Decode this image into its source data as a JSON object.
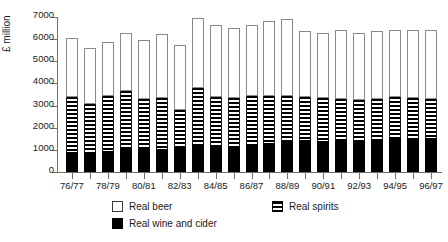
{
  "chart_data": {
    "type": "bar",
    "stacked": true,
    "title": "",
    "xlabel": "",
    "ylabel": "£ million",
    "ylim": [
      0,
      7000
    ],
    "ytick_values": [
      0,
      1000,
      2000,
      3000,
      4000,
      5000,
      6000,
      7000
    ],
    "ytick_labels": [
      "0",
      "1000",
      "2000",
      "3000",
      "4000",
      "5000",
      "6000",
      "7000"
    ],
    "grid": false,
    "legend_position": "below-plot",
    "categories": [
      "76/77",
      "77/78",
      "78/79",
      "79/80",
      "80/81",
      "81/82",
      "82/83",
      "83/84",
      "84/85",
      "85/86",
      "86/87",
      "87/88",
      "88/89",
      "89/90",
      "90/91",
      "91/92",
      "92/93",
      "93/94",
      "94/95",
      "95/96",
      "96/97"
    ],
    "xtick_labels_shown": [
      "76/77",
      "78/79",
      "80/81",
      "82/83",
      "84/85",
      "86/87",
      "88/89",
      "90/91",
      "92/93",
      "94/95",
      "96/97"
    ],
    "series": [
      {
        "name": "Real wine and cider",
        "style": "solid-black",
        "color": "#000000",
        "values": [
          900,
          900,
          950,
          1050,
          1050,
          1050,
          1100,
          1250,
          1200,
          1150,
          1200,
          1300,
          1400,
          1450,
          1400,
          1400,
          1450,
          1500,
          1600,
          1550,
          1550
        ]
      },
      {
        "name": "Real spirits",
        "style": "horizontal-stripes",
        "color": "#000000",
        "values": [
          2500,
          2150,
          2500,
          2600,
          2250,
          2300,
          1700,
          2550,
          2200,
          2200,
          2250,
          2150,
          2050,
          1950,
          1950,
          1900,
          1800,
          1800,
          1800,
          1800,
          1750
        ]
      },
      {
        "name": "Real beer",
        "style": "white-outline",
        "color": "#ffffff",
        "values": [
          2650,
          2550,
          2400,
          2650,
          2650,
          2900,
          2950,
          3150,
          3250,
          3150,
          3200,
          3350,
          3450,
          2950,
          2950,
          3100,
          3050,
          3050,
          3000,
          3050,
          3100
        ]
      }
    ],
    "totals": [
      6050,
      5600,
      5850,
      6300,
      5950,
      6250,
      5750,
      6950,
      6650,
      6500,
      6650,
      6800,
      6900,
      6350,
      6300,
      6400,
      6300,
      6350,
      6400,
      6400,
      6400
    ]
  },
  "legend": {
    "entries": [
      {
        "label": "Real beer",
        "swatch": "white-square-icon"
      },
      {
        "label": "Real wine and cider",
        "swatch": "black-square-icon"
      },
      {
        "label": "Real spirits",
        "swatch": "striped-square-icon"
      }
    ]
  }
}
